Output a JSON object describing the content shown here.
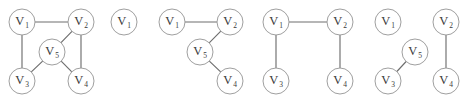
{
  "figure": {
    "background_color": "#ffffff",
    "node_fill": "#ffffff",
    "node_stroke": "#9a9a9a",
    "edge_color": "#6e6e6e",
    "label_color": "#3a3a3a",
    "node_radius": 13,
    "panel_count": 5
  },
  "graphs": [
    {
      "id": "graph-1",
      "nodes": [
        {
          "id": "v1",
          "label": "V",
          "sub": "1",
          "cx": 22,
          "cy": 22
        },
        {
          "id": "v2",
          "label": "V",
          "sub": "2",
          "cx": 81,
          "cy": 22
        },
        {
          "id": "v5",
          "label": "V",
          "sub": "5",
          "cx": 52,
          "cy": 52
        },
        {
          "id": "v3",
          "label": "V",
          "sub": "3",
          "cx": 22,
          "cy": 81
        },
        {
          "id": "v4",
          "label": "V",
          "sub": "4",
          "cx": 81,
          "cy": 81
        }
      ],
      "edges": [
        {
          "from": "v1",
          "to": "v2"
        },
        {
          "from": "v1",
          "to": "v3"
        },
        {
          "from": "v2",
          "to": "v4"
        },
        {
          "from": "v2",
          "to": "v5"
        },
        {
          "from": "v5",
          "to": "v3"
        },
        {
          "from": "v5",
          "to": "v4"
        }
      ]
    },
    {
      "id": "graph-2",
      "nodes": [
        {
          "id": "v1",
          "label": "V",
          "sub": "1",
          "cx": 124,
          "cy": 22
        }
      ],
      "edges": []
    },
    {
      "id": "graph-3",
      "nodes": [
        {
          "id": "v1",
          "label": "V",
          "sub": "1",
          "cx": 172,
          "cy": 22
        },
        {
          "id": "v2",
          "label": "V",
          "sub": "2",
          "cx": 230,
          "cy": 22
        },
        {
          "id": "v5",
          "label": "V",
          "sub": "5",
          "cx": 200,
          "cy": 52
        },
        {
          "id": "v4",
          "label": "V",
          "sub": "4",
          "cx": 230,
          "cy": 81
        }
      ],
      "edges": [
        {
          "from": "v1",
          "to": "v2"
        },
        {
          "from": "v2",
          "to": "v5"
        },
        {
          "from": "v5",
          "to": "v4"
        }
      ]
    },
    {
      "id": "graph-4",
      "nodes": [
        {
          "id": "v1",
          "label": "V",
          "sub": "1",
          "cx": 276,
          "cy": 22
        },
        {
          "id": "v2",
          "label": "V",
          "sub": "2",
          "cx": 340,
          "cy": 22
        },
        {
          "id": "v3",
          "label": "V",
          "sub": "3",
          "cx": 276,
          "cy": 81
        },
        {
          "id": "v4",
          "label": "V",
          "sub": "4",
          "cx": 340,
          "cy": 81
        }
      ],
      "edges": [
        {
          "from": "v1",
          "to": "v2"
        },
        {
          "from": "v1",
          "to": "v3"
        },
        {
          "from": "v2",
          "to": "v4"
        }
      ]
    },
    {
      "id": "graph-5",
      "nodes": [
        {
          "id": "v1",
          "label": "V",
          "sub": "1",
          "cx": 388,
          "cy": 22
        },
        {
          "id": "v2",
          "label": "V",
          "sub": "2",
          "cx": 446,
          "cy": 22
        },
        {
          "id": "v5",
          "label": "V",
          "sub": "5",
          "cx": 415,
          "cy": 52
        },
        {
          "id": "v3",
          "label": "V",
          "sub": "3",
          "cx": 388,
          "cy": 81
        },
        {
          "id": "v4",
          "label": "V",
          "sub": "4",
          "cx": 446,
          "cy": 81
        }
      ],
      "edges": [
        {
          "from": "v2",
          "to": "v4"
        },
        {
          "from": "v5",
          "to": "v3"
        }
      ]
    }
  ]
}
